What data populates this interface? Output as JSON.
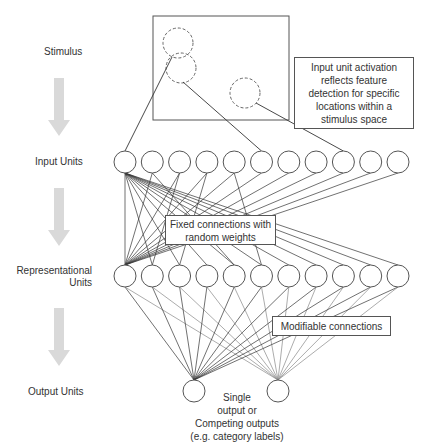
{
  "stages": {
    "stimulus": "Stimulus",
    "input_units": "Input Units",
    "representational_units_line1": "Representational",
    "representational_units_line2": "Units",
    "output_units": "Output Units"
  },
  "callouts": {
    "input_activation": [
      "Input unit activation",
      "reflects feature",
      "detection for specific",
      "locations within a",
      "stimulus space"
    ],
    "fixed_connections": [
      "Fixed connections with",
      "random weights"
    ],
    "modifiable_connections": "Modifiable connections"
  },
  "output_note": [
    "Single",
    "output or",
    "Competing outputs",
    "(e.g. category labels)"
  ],
  "layers": {
    "input_units_count": 11,
    "representational_units_count": 11,
    "output_units_count": 2
  },
  "colors": {
    "line": "#333333",
    "light_line": "#888888",
    "arrow": "#d9d9d9",
    "dashed_circle": "#666666"
  }
}
